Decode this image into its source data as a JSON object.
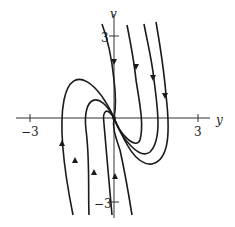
{
  "figure": {
    "type": "phase-portrait",
    "axes": {
      "x_label": "y",
      "y_label": "v",
      "x_ticks": [
        "-3",
        "3"
      ],
      "y_ticks": [
        "3",
        "-3"
      ],
      "x_tick_labels": {
        "neg": "−3",
        "pos": "3"
      },
      "y_tick_labels": {
        "pos": "3",
        "neg": "−3"
      }
    },
    "colors": {
      "curve": "#1a1a1a",
      "axis": "#333333",
      "background": "#ffffff"
    },
    "curves": [
      {
        "name": "trajectory-1",
        "d": "M102,24 C108,40 112,60 114,80 C116,96 116,108 114,118 C112,128 116,138 120,150 C124,168 128,190 132,215",
        "arrows": [
          [
            114,
            62,
            "down"
          ],
          [
            115,
            176,
            "up"
          ]
        ]
      },
      {
        "name": "trajectory-2",
        "d": "M127,25 C131,45 134,60 136,80 C140,105 144,125 140,140 C136,150 120,135 114,118 C108,108 102,108 104,124 C106,150 110,190 112,215",
        "arrows": [
          [
            136,
            67,
            "down"
          ],
          [
            94,
            172,
            "up"
          ]
        ]
      },
      {
        "name": "trajectory-3",
        "d": "M144,24 C148,45 152,60 154,80 C158,110 162,140 150,152 C140,160 122,140 114,118 C100,90 82,95 86,130 C90,160 88,190 89,215",
        "arrows": [
          [
            153,
            78,
            "down"
          ],
          [
            75,
            160,
            "up"
          ]
        ]
      },
      {
        "name": "trajectory-4",
        "d": "M156,22 C160,45 164,70 166,95 C170,130 170,160 152,164 C135,166 124,140 114,118 C100,85 72,60 64,100 C58,130 66,180 73,215",
        "arrows": [
          [
            165,
            96,
            "down"
          ],
          [
            62,
            143,
            "up"
          ]
        ]
      }
    ]
  }
}
